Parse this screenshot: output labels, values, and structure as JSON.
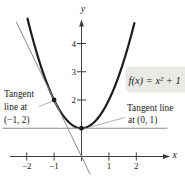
{
  "figure": {
    "formula_label": "f(x) = x² + 1",
    "x_axis_label": "x",
    "y_axis_label": "y",
    "annotations": {
      "tangent_left": {
        "line1": "Tangent",
        "line2": "line at",
        "line3": "(−1, 2)"
      },
      "tangent_right": {
        "line1": "Tangent line",
        "line2": "at (0, 1)"
      }
    }
  },
  "colors": {
    "curve": "#1d1d1d",
    "tangent_line": "#8a8a8a",
    "axis": "#3f3f3f",
    "text": "#1c1c1c",
    "callout_bg": "#e9e9e5",
    "pointer_line": "#999999"
  },
  "chart_data": {
    "type": "line",
    "xlabel": "x",
    "ylabel": "y",
    "xlim": [
      -2.6,
      3.5
    ],
    "ylim": [
      -0.8,
      4.9
    ],
    "grid": false,
    "x_ticks": [
      -2,
      -1,
      1,
      2
    ],
    "y_ticks": [
      2,
      3,
      4
    ],
    "series": [
      {
        "name": "f(x) = x² + 1",
        "fn": "quadratic",
        "a": 1,
        "b": 0,
        "c": 1,
        "x_range": [
          -1.97,
          1.97
        ],
        "color": "#1d1d1d",
        "width": 2.2
      },
      {
        "name": "tangent at (−1, 2): y = −2x",
        "fn": "linear",
        "slope": -2,
        "intercept": 0,
        "x_range": [
          -2.38,
          0.315
        ],
        "color": "#8a8a8a",
        "width": 1
      },
      {
        "name": "tangent at (0, 1): y = 1",
        "fn": "linear",
        "slope": 0,
        "intercept": 1,
        "x_range": [
          -2.87,
          3.12
        ],
        "color": "#8a8a8a",
        "width": 1
      }
    ],
    "points": [
      {
        "x": -1,
        "y": 2,
        "label": "(−1, 2)"
      },
      {
        "x": 0,
        "y": 1,
        "label": "(0, 1)"
      }
    ]
  }
}
